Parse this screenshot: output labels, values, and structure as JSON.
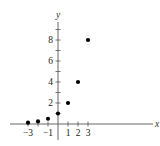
{
  "chart_data": {
    "type": "scatter",
    "title": "",
    "xlabel": "x",
    "ylabel": "y",
    "x": [
      -3,
      -2,
      -1,
      0,
      1,
      2,
      3
    ],
    "y": [
      0.125,
      0.25,
      0.5,
      1,
      2,
      4,
      8
    ],
    "xlim": [
      -4.8,
      9.7
    ],
    "ylim": [
      -1.5,
      11.0
    ],
    "x_ticks": [
      -3,
      -2,
      -1,
      1,
      2,
      3
    ],
    "x_tick_labels": [
      "−3",
      "−1",
      "1",
      "2",
      "3"
    ],
    "x_tick_labels_positions": [
      -3,
      -1,
      1,
      2,
      3
    ],
    "y_ticks": [
      1,
      2,
      3,
      4,
      5,
      6,
      7,
      8,
      9
    ],
    "y_tick_labels": [
      "2",
      "4",
      "6",
      "8"
    ],
    "y_tick_labels_positions": [
      2,
      4,
      6,
      8
    ],
    "grid": false,
    "legend": null,
    "marker_color": "#000000",
    "axis_color": "#555555"
  },
  "labels": {
    "x_axis": "x",
    "y_axis": "y"
  }
}
